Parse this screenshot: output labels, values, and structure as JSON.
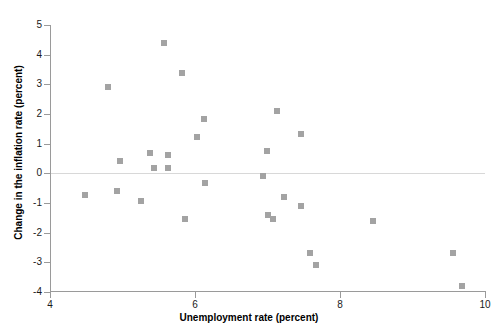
{
  "chart_data": {
    "type": "scatter",
    "title": "",
    "xlabel": "Unemployment rate (percent)",
    "ylabel": "Change in the inflation rate (percent)",
    "xlim": [
      4,
      10
    ],
    "ylim": [
      -4,
      5
    ],
    "xticks": [
      4,
      6,
      8,
      10
    ],
    "xtick_labels": [
      "4",
      "6",
      "8",
      "10"
    ],
    "yticks": [
      5,
      4,
      3,
      2,
      1,
      0,
      -1,
      -2,
      -3,
      -4
    ],
    "ytick_labels": [
      "5",
      "4",
      "3",
      "2",
      "1",
      "0",
      "-1",
      "-2",
      "-3",
      "-4"
    ],
    "grid": false,
    "legend": false,
    "reference_lines": [
      {
        "name": "zero-line",
        "axis": "y",
        "value": 0,
        "color": "#d8d8d8"
      }
    ],
    "marker": {
      "shape": "square",
      "color": "#a3a3a3",
      "size": 6
    },
    "points": [
      {
        "x": 4.48,
        "y": -0.72
      },
      {
        "x": 4.8,
        "y": 2.91
      },
      {
        "x": 4.92,
        "y": -0.59
      },
      {
        "x": 4.96,
        "y": 0.43
      },
      {
        "x": 5.26,
        "y": -0.94
      },
      {
        "x": 5.38,
        "y": 0.68
      },
      {
        "x": 5.44,
        "y": 0.18
      },
      {
        "x": 5.57,
        "y": 4.39
      },
      {
        "x": 5.63,
        "y": 0.18
      },
      {
        "x": 5.63,
        "y": 0.62
      },
      {
        "x": 5.82,
        "y": 3.38
      },
      {
        "x": 5.86,
        "y": -1.55
      },
      {
        "x": 6.03,
        "y": 1.22
      },
      {
        "x": 6.12,
        "y": 1.83
      },
      {
        "x": 6.14,
        "y": -0.32
      },
      {
        "x": 6.94,
        "y": -0.08
      },
      {
        "x": 6.99,
        "y": 0.76
      },
      {
        "x": 7.01,
        "y": -1.42
      },
      {
        "x": 7.07,
        "y": -1.55
      },
      {
        "x": 7.13,
        "y": 2.1
      },
      {
        "x": 7.23,
        "y": -0.81
      },
      {
        "x": 7.46,
        "y": 1.32
      },
      {
        "x": 7.46,
        "y": -1.1
      },
      {
        "x": 7.59,
        "y": -2.69
      },
      {
        "x": 7.67,
        "y": -3.09
      },
      {
        "x": 8.46,
        "y": -1.6
      },
      {
        "x": 9.56,
        "y": -2.69
      },
      {
        "x": 9.68,
        "y": -3.81
      }
    ]
  }
}
